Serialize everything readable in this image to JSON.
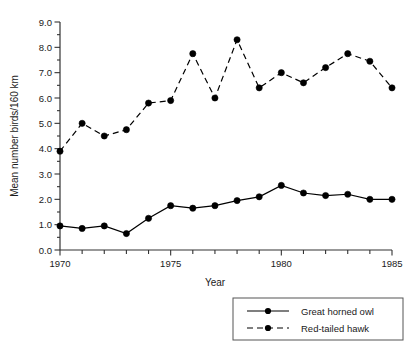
{
  "chart_data": {
    "type": "line",
    "title": "",
    "xlabel": "Year",
    "ylabel": "Mean number birds/160 km",
    "x": [
      1970,
      1971,
      1972,
      1973,
      1974,
      1975,
      1976,
      1977,
      1978,
      1979,
      1980,
      1981,
      1982,
      1983,
      1984,
      1985
    ],
    "xlim": [
      1970,
      1985
    ],
    "ylim": [
      0.0,
      9.0
    ],
    "xticks": [
      1970,
      1971,
      1972,
      1973,
      1974,
      1975,
      1976,
      1977,
      1978,
      1979,
      1980,
      1981,
      1982,
      1983,
      1984,
      1985
    ],
    "xtick_labels": [
      "1970",
      "",
      "",
      "",
      "",
      "1975",
      "",
      "",
      "",
      "",
      "1980",
      "",
      "",
      "",
      "",
      "1985"
    ],
    "yticks": [
      0.0,
      0.5,
      1.0,
      1.5,
      2.0,
      2.5,
      3.0,
      3.5,
      4.0,
      4.5,
      5.0,
      5.5,
      6.0,
      6.5,
      7.0,
      7.5,
      8.0,
      8.5,
      9.0
    ],
    "ytick_labels": [
      "0.0",
      "",
      "1.0",
      "",
      "2.0",
      "",
      "3.0",
      "",
      "4.0",
      "",
      "5.0",
      "",
      "6.0",
      "",
      "7.0",
      "",
      "8.0",
      "",
      "9.0"
    ],
    "grid": false,
    "legend_position": "bottom-right",
    "series": [
      {
        "name": "Great horned owl",
        "style": "solid",
        "marker": "circle",
        "color": "#000000",
        "values": [
          0.95,
          0.85,
          0.95,
          0.65,
          1.25,
          1.75,
          1.65,
          1.75,
          1.95,
          2.1,
          2.55,
          2.25,
          2.15,
          2.2,
          2.0,
          2.0
        ]
      },
      {
        "name": "Red-tailed hawk",
        "style": "dashed",
        "marker": "circle",
        "color": "#000000",
        "values": [
          3.9,
          5.0,
          4.5,
          4.75,
          5.8,
          5.9,
          7.75,
          6.0,
          8.3,
          6.4,
          7.0,
          6.6,
          7.2,
          7.75,
          7.45,
          6.4
        ]
      }
    ]
  },
  "legend": {
    "items": [
      {
        "label": "Great horned owl",
        "style": "solid"
      },
      {
        "label": "Red-tailed hawk",
        "style": "dashed"
      }
    ]
  }
}
